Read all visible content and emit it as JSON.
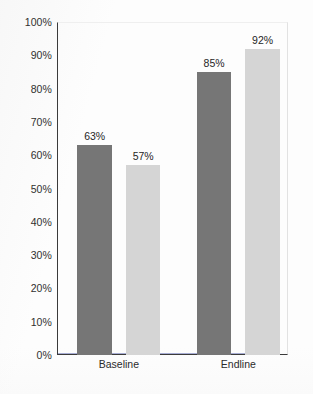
{
  "chart_data": {
    "type": "bar",
    "title": "",
    "subtitle": "",
    "xlabel": "",
    "ylabel": "",
    "categories": [
      "Baseline",
      "Endline"
    ],
    "series": [
      {
        "name": "Hospital",
        "values": [
          63,
          85
        ],
        "color": "#767676",
        "value_labels": [
          "63%",
          "85%"
        ]
      },
      {
        "name": "Community",
        "values": [
          57,
          92
        ],
        "color": "#d5d5d5",
        "value_labels": [
          "57%",
          "92%"
        ]
      }
    ],
    "ylim": [
      0,
      100
    ],
    "ytick_step": 10,
    "ytick_labels": [
      "100%",
      "90%",
      "80%",
      "70%",
      "60%",
      "50%",
      "40%",
      "30%",
      "20%",
      "10%",
      "0%"
    ],
    "ytick_values": [
      100,
      90,
      80,
      70,
      60,
      50,
      40,
      30,
      20,
      10,
      0
    ],
    "grid": false,
    "legend": "none",
    "in_bar_labels": true,
    "value_label_position": "above-bar",
    "axis_color": "#3b3b3b",
    "background_color": "#fdfdfd"
  },
  "bars": [
    {
      "group": "Baseline",
      "series": "Hospital",
      "value": 63,
      "value_label": "63%",
      "inner_label": "Hospital",
      "color": "#767676"
    },
    {
      "group": "Baseline",
      "series": "Community",
      "value": 57,
      "value_label": "57%",
      "inner_label": "Community",
      "color": "#d5d5d5"
    },
    {
      "group": "Endline",
      "series": "Hospital",
      "value": 85,
      "value_label": "85%",
      "inner_label": "Hospital",
      "color": "#767676"
    },
    {
      "group": "Endline",
      "series": "Community",
      "value": 92,
      "value_label": "92%",
      "inner_label": "Community",
      "color": "#d5d5d5"
    }
  ]
}
